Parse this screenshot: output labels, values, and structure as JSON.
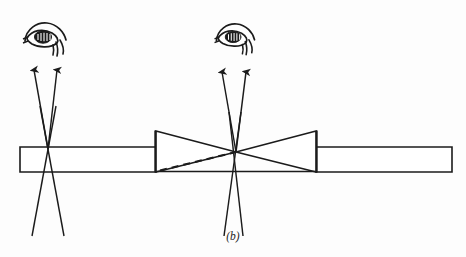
{
  "figure": {
    "caption": "(b)",
    "alt_description": "Optical ray diagram: a light beam inside a rectangular waveguide is focused by a pair of opposed triangular (prism / conical taper) elements; an observer eye at left sees diverging rays from a crossing point at the guide surface, an observer eye at right sees diverging rays from the taper apex, with a dashed virtual ray drawn from the lower-left taper corner to the apex.",
    "background_color": "#fdfdfd",
    "stroke_color": "#1b1b1b",
    "line_width": 1.4
  },
  "geometry": {
    "bar": {
      "label": "waveguide-bar",
      "top_y": 147,
      "bottom_y": 172,
      "left_x": 20,
      "right_x": 452,
      "left_segment": {
        "x1": 20,
        "x2": 156
      },
      "right_segment": {
        "x1": 316,
        "x2": 452
      }
    },
    "left_taper": {
      "label": "left-triangular-element",
      "base_x": 156,
      "base_top_y": 131,
      "base_bottom_y": 172,
      "apex_x": 236,
      "apex_y": 152
    },
    "right_taper": {
      "label": "right-triangular-element",
      "base_x": 316,
      "base_top_y": 131,
      "base_bottom_y": 172,
      "apex_x": 236,
      "apex_y": 152
    },
    "dashed_ray": {
      "label": "virtual-ray-dashed",
      "x1": 160,
      "y1": 171,
      "x2": 236,
      "y2": 152,
      "dash_pattern": "7 5"
    },
    "left_crossing_point": {
      "x": 48,
      "y": 149
    },
    "right_crossing_point": {
      "x": 236,
      "y": 152
    }
  },
  "rays": {
    "left_upper_rays": [
      {
        "name": "left-ray-outer-left",
        "x1": 48,
        "y1": 149,
        "x2": 33,
        "y2": 66
      },
      {
        "name": "left-ray-outer-right",
        "x1": 48,
        "y1": 149,
        "x2": 58,
        "y2": 66
      }
    ],
    "left_lower_rays": [
      {
        "name": "left-ray-down-left",
        "x1": 48,
        "y1": 149,
        "x2": 32,
        "y2": 236
      },
      {
        "name": "left-ray-down-right",
        "x1": 48,
        "y1": 149,
        "x2": 64,
        "y2": 236
      }
    ],
    "right_upper_rays": [
      {
        "name": "right-ray-outer-left",
        "x1": 236,
        "y1": 152,
        "x2": 221,
        "y2": 68
      },
      {
        "name": "right-ray-outer-right",
        "x1": 236,
        "y1": 152,
        "x2": 247,
        "y2": 68
      }
    ],
    "right_lower_rays": [
      {
        "name": "right-ray-down-left",
        "x1": 236,
        "y1": 152,
        "x2": 224,
        "y2": 236
      },
      {
        "name": "right-ray-down-right",
        "x1": 236,
        "y1": 152,
        "x2": 243,
        "y2": 236
      }
    ]
  },
  "eyes": [
    {
      "name": "left-eye",
      "cx": 45,
      "cy": 37,
      "scale": 1.0
    },
    {
      "name": "right-eye",
      "cx": 235,
      "cy": 37,
      "scale": 0.92
    }
  ],
  "arrowheads": [
    {
      "name": "left-arrow-1",
      "x": 33,
      "y": 66
    },
    {
      "name": "left-arrow-2",
      "x": 58,
      "y": 66
    },
    {
      "name": "right-arrow-1",
      "x": 221,
      "y": 68
    },
    {
      "name": "right-arrow-2",
      "x": 247,
      "y": 68
    }
  ],
  "caption_position": {
    "x": 233,
    "y": 240
  }
}
